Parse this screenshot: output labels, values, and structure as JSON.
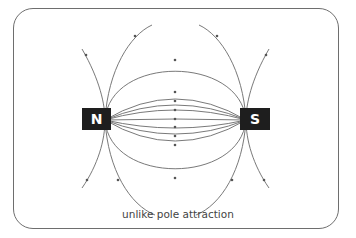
{
  "diagram": {
    "caption": "unlike pole attraction",
    "magnets": [
      {
        "label": "N",
        "pole": "north"
      },
      {
        "label": "S",
        "pole": "south"
      }
    ],
    "colors": {
      "frame": "#6e6e6e",
      "field_line": "#666666",
      "magnet_fill": "#1e1e1e",
      "magnet_text": "#ffffff"
    }
  }
}
